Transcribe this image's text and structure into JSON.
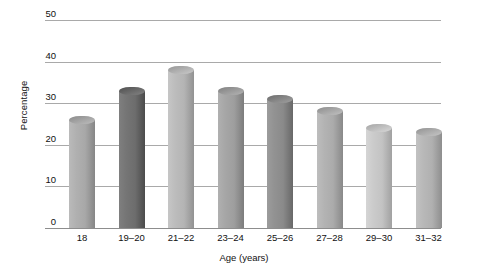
{
  "chart_data": {
    "type": "bar",
    "title": "",
    "subtitle": "",
    "xlabel": "Age (years)",
    "ylabel": "Percentage",
    "categories": [
      "18",
      "19–20",
      "21–22",
      "23–24",
      "25–26",
      "27–28",
      "29–30",
      "31–32"
    ],
    "values": [
      27,
      34,
      39,
      34,
      32,
      29,
      25,
      24
    ],
    "ylim": [
      0,
      50
    ],
    "yticks": [
      0,
      10,
      20,
      30,
      40,
      50
    ],
    "ytick_labels": [
      "0",
      "10",
      "20",
      "30",
      "40",
      "50"
    ],
    "grid": "horizontal",
    "legend": "none",
    "bar_colors": [
      "#a8a8a8",
      "#6d6d6d",
      "#b4b4b4",
      "#9e9e9e",
      "#8a8a8a",
      "#ababab",
      "#c3c3c3",
      "#b0b0b0"
    ],
    "series": [
      {
        "name": "Percentage",
        "values": [
          27,
          34,
          39,
          34,
          32,
          29,
          25,
          24
        ]
      }
    ],
    "axis_color": "#8d8d8d",
    "gridline_color": "#9a9a9a",
    "background": "#ffffff"
  }
}
